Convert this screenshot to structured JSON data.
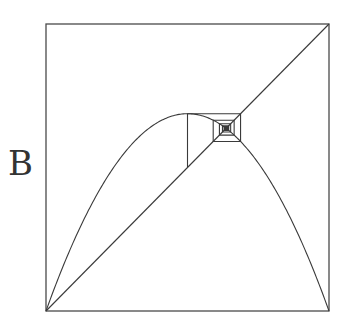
{
  "panel": {
    "label": "B"
  },
  "diagram": {
    "type": "cobweb",
    "map": "logistic",
    "r": 2.75,
    "x0": 0.5,
    "iterations": 60,
    "frame": {
      "left": 46,
      "top": 24,
      "right": 329,
      "bottom": 311
    },
    "stroke_color": "#3a3a3a",
    "frame_color": "#4a4a4a"
  }
}
